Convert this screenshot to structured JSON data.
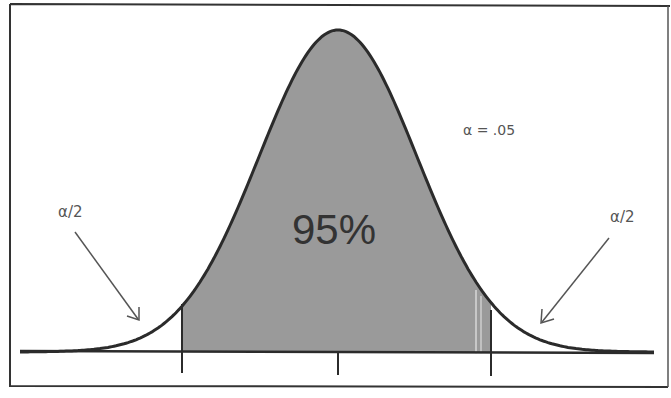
{
  "diagram": {
    "type": "normal-distribution-confidence-interval",
    "center_label": "95%",
    "alpha_label": "α = .05",
    "left_tail_label": "α/2",
    "right_tail_label": "α/2",
    "colors": {
      "shaded_region": "#9a9a9a",
      "curve": "#2b2b2b",
      "axis": "#2b2b2b",
      "frame": "#333333",
      "arrow": "#555555",
      "text": "#555555",
      "background": "#ffffff"
    }
  },
  "chart_data": {
    "type": "area",
    "title": "",
    "distribution": "standard normal",
    "shaded_area_percent": 95,
    "alpha": 0.05,
    "tail_area_each": 0.025,
    "critical_values": [
      -1.96,
      1.96
    ],
    "ticks": [
      "-z",
      "0",
      "+z"
    ],
    "annotations": [
      "95%",
      "α = .05",
      "α/2 (left tail)",
      "α/2 (right tail)"
    ],
    "grid": false,
    "legend": null
  }
}
